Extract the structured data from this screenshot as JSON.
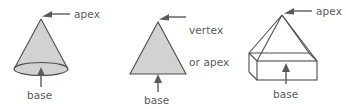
{
  "image": {
    "title": "Geometric solids labelled with apex and base",
    "width": 346,
    "height": 109,
    "background_color": "#ffffff"
  },
  "style": {
    "fill_color": "#d2d2d2",
    "stroke_color": "#4d4d4d",
    "text_color": "#5a5a5a",
    "arrow_color": "#5a5a5a"
  },
  "figures": [
    {
      "id": "cone",
      "shape_name": "cone",
      "labels": {
        "apex": "apex",
        "base": "base"
      }
    },
    {
      "id": "triangle",
      "shape_name": "triangle",
      "labels": {
        "apex_line1": "vertex",
        "apex_line2": "or apex",
        "base": "base"
      }
    },
    {
      "id": "pyramid",
      "shape_name": "pyramid-on-rectangular-prism",
      "labels": {
        "apex": "apex",
        "base": "base"
      }
    }
  ]
}
